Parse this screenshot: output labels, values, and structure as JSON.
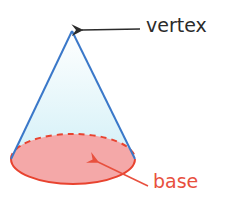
{
  "diagram": {
    "shape": "cone",
    "labels": {
      "vertex": "vertex",
      "base": "base"
    },
    "colors": {
      "cone_edge": "#3a78c9",
      "cone_fill": "#d8f0f7",
      "base_fill": "#f4a3a3",
      "base_edge": "#e8432f",
      "vertex_arrow": "#2b2b2b",
      "base_arrow": "#e8503e",
      "vertex_text": "#2b2b2b",
      "base_text": "#e8503e"
    }
  }
}
